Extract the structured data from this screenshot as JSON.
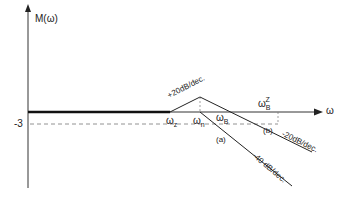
{
  "diagram": {
    "y_axis_label": "M(ω)",
    "x_axis_label": "ω",
    "y_tick": "-3",
    "break_labels": {
      "wz": {
        "base": "ω",
        "sub": "z"
      },
      "wn": {
        "base": "ω",
        "sub": "n"
      },
      "wB": {
        "base": "ω",
        "sub": "B"
      },
      "wBZ": {
        "base": "ω",
        "sub": "B",
        "sup": "Z"
      }
    },
    "slope_labels": {
      "rise": "+20dB/dec.",
      "fall_b": "-20dB/dec.",
      "fall_a": "-40 dB/dec."
    },
    "curve_labels": {
      "a": "(a)",
      "b": "(b)"
    },
    "colors": {
      "line": "#222222",
      "dashed": "#777777"
    }
  }
}
